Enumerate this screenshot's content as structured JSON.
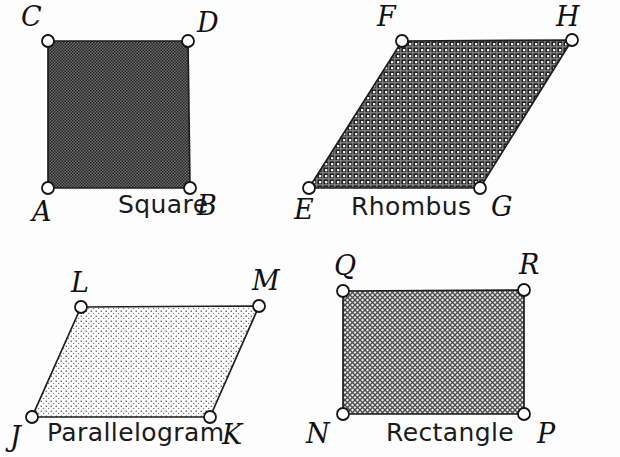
{
  "figure": {
    "background_color": "#fdfdfd",
    "outline_color": "#1d1d1d",
    "vertex_fill_color": "#ffffff",
    "vertex_stroke_color": "#141414"
  },
  "shapes": [
    {
      "id": "square",
      "name": "Square",
      "fill_pattern": "dense-dark-checker",
      "fill_color": "#4a4a4a",
      "name_label_x": 118,
      "name_label_y": 213,
      "points": "48,41 188,41 190,188 48,188",
      "vertices": [
        {
          "label": "A",
          "cx": 48,
          "cy": 188,
          "label_x": 32,
          "label_y": 221
        },
        {
          "label": "B",
          "cx": 190,
          "cy": 188,
          "label_x": 197,
          "label_y": 215
        },
        {
          "label": "C",
          "cx": 48,
          "cy": 41,
          "label_x": 21,
          "label_y": 26
        },
        {
          "label": "D",
          "cx": 188,
          "cy": 41,
          "label_x": 197,
          "label_y": 32
        }
      ]
    },
    {
      "id": "rhombus",
      "name": "Rhombus",
      "fill_pattern": "dark-weave-grid",
      "fill_color": "#3c3c3c",
      "name_label_x": 351,
      "name_label_y": 215,
      "points": "402,41 572,40 480,188 309,188",
      "vertices": [
        {
          "label": "E",
          "cx": 309,
          "cy": 188,
          "label_x": 294,
          "label_y": 219
        },
        {
          "label": "F",
          "cx": 402,
          "cy": 41,
          "label_x": 377,
          "label_y": 26
        },
        {
          "label": "G",
          "cx": 480,
          "cy": 188,
          "label_x": 491,
          "label_y": 216
        },
        {
          "label": "H",
          "cx": 572,
          "cy": 40,
          "label_x": 556,
          "label_y": 26
        }
      ]
    },
    {
      "id": "parallelogram",
      "name": "Parallelogram",
      "fill_pattern": "light-stipple-dots",
      "fill_color": "#b9b9b9",
      "name_label_x": 47,
      "name_label_y": 441,
      "points": "81,307 259,306 210,417 32,417",
      "vertices": [
        {
          "label": "J",
          "cx": 32,
          "cy": 417,
          "label_x": 10,
          "label_y": 446
        },
        {
          "label": "K",
          "cx": 210,
          "cy": 417,
          "label_x": 222,
          "label_y": 444
        },
        {
          "label": "L",
          "cx": 81,
          "cy": 307,
          "label_x": 71,
          "label_y": 292
        },
        {
          "label": "M",
          "cx": 259,
          "cy": 306,
          "label_x": 252,
          "label_y": 290
        }
      ]
    },
    {
      "id": "rectangle",
      "name": "Rectangle",
      "fill_pattern": "medium-gray-crosshatch",
      "fill_color": "#8e8e8e",
      "name_label_x": 386,
      "name_label_y": 441,
      "points": "343,291 524,290 524,414 343,414",
      "vertices": [
        {
          "label": "N",
          "cx": 343,
          "cy": 414,
          "label_x": 306,
          "label_y": 443
        },
        {
          "label": "P",
          "cx": 524,
          "cy": 414,
          "label_x": 537,
          "label_y": 443
        },
        {
          "label": "Q",
          "cx": 343,
          "cy": 291,
          "label_x": 334,
          "label_y": 275
        },
        {
          "label": "R",
          "cx": 524,
          "cy": 290,
          "label_x": 519,
          "label_y": 274
        }
      ]
    }
  ]
}
